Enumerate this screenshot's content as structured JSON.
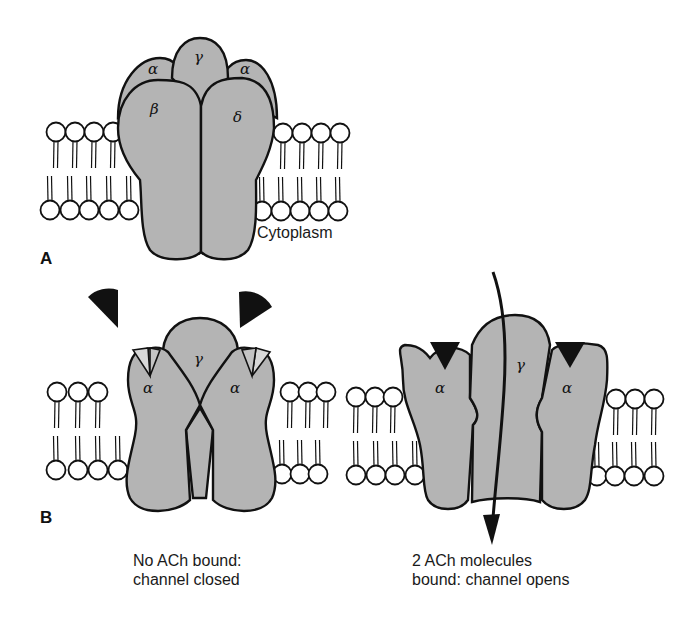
{
  "figure": {
    "colors": {
      "protein_fill": "#b4b4b4",
      "outline": "#111111",
      "ach_molecule": "#111111",
      "lipid_head": "#ffffff"
    }
  },
  "panel_a": {
    "letter": "A",
    "subunits": [
      "α",
      "γ",
      "α",
      "β",
      "δ"
    ],
    "region_label": "Cytoplasm"
  },
  "panel_b": {
    "letter": "B",
    "closed": {
      "subunits": [
        "α",
        "γ",
        "α"
      ],
      "caption_line1": "No ACh bound:",
      "caption_line2": "channel closed"
    },
    "open": {
      "subunits": [
        "α",
        "γ",
        "α"
      ],
      "caption_line1": "2 ACh molecules",
      "caption_line2": "bound: channel opens"
    }
  }
}
